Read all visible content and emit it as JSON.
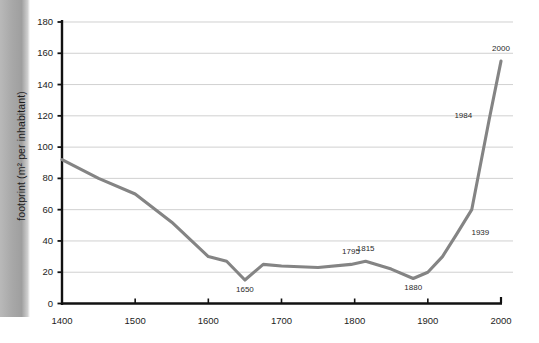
{
  "chart_data": {
    "type": "line",
    "title": "",
    "subtitle": "",
    "xlabel": "",
    "ylabel": "footprint (m² per inhabitant)",
    "grid": "horizontal",
    "legend": "none",
    "xlim": [
      1400,
      2000
    ],
    "ylim": [
      0,
      180
    ],
    "x_ticks": [
      "1400",
      "1500",
      "1600",
      "1700",
      "1800",
      "1900",
      "2000"
    ],
    "y_ticks": [
      "0",
      "20",
      "40",
      "60",
      "80",
      "100",
      "120",
      "140",
      "160",
      "180"
    ],
    "line_color": "#848484",
    "grid_color": "#c8c8c8",
    "axis_color": "#111111",
    "x": [
      1400,
      1450,
      1500,
      1550,
      1600,
      1625,
      1650,
      1675,
      1700,
      1750,
      1795,
      1815,
      1850,
      1880,
      1900,
      1920,
      1939,
      1960,
      1984,
      2000
    ],
    "values": [
      92,
      80,
      70,
      52,
      30,
      27,
      15,
      25,
      24,
      23,
      25,
      27,
      22,
      16,
      20,
      30,
      44,
      60,
      118,
      155
    ],
    "series": [
      {
        "name": "footprint (m² per inhabitant)",
        "values": [
          92,
          80,
          70,
          52,
          30,
          27,
          15,
          25,
          24,
          23,
          25,
          27,
          22,
          16,
          20,
          30,
          44,
          60,
          118,
          155
        ]
      }
    ],
    "annotations": [
      {
        "label": "1650",
        "x": 1650,
        "y": 15,
        "position": "below"
      },
      {
        "label": "1795",
        "x": 1795,
        "y": 25,
        "position": "above"
      },
      {
        "label": "1815",
        "x": 1815,
        "y": 27,
        "position": "above"
      },
      {
        "label": "1880",
        "x": 1880,
        "y": 16,
        "position": "below"
      },
      {
        "label": "1939",
        "x": 1939,
        "y": 44,
        "position": "right"
      },
      {
        "label": "1984",
        "x": 1984,
        "y": 118,
        "position": "left"
      },
      {
        "label": "2000",
        "x": 2000,
        "y": 155,
        "position": "above"
      }
    ]
  }
}
